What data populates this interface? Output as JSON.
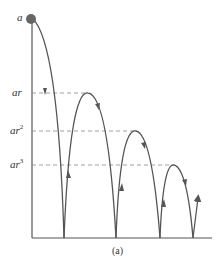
{
  "diagram": {
    "caption": "(a)",
    "labels": {
      "a": "a",
      "ar": "ar",
      "ar2_base": "ar",
      "ar2_exp": "2",
      "ar3_base": "ar",
      "ar3_exp": "3"
    },
    "colors": {
      "curve": "#555555",
      "ball": "#666666",
      "dashed": "#888888",
      "text": "#333333"
    }
  }
}
